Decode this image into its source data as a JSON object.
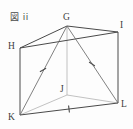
{
  "figure": {
    "caption": "図 ii",
    "background_color": "#fdfdfd",
    "line_color": "#4a4a4a",
    "hidden_line_color": "#9a9a9a",
    "label_color": "#3c3c3c",
    "shape": "triangular-prism",
    "vertices": [
      {
        "id": "G",
        "label": "G",
        "x": 67,
        "y": 26,
        "hidden": false
      },
      {
        "id": "I",
        "label": "I",
        "x": 118,
        "y": 32,
        "hidden": false
      },
      {
        "id": "H",
        "label": "H",
        "x": 20,
        "y": 48,
        "hidden": false
      },
      {
        "id": "J",
        "label": "J",
        "x": 67,
        "y": 95,
        "hidden": true
      },
      {
        "id": "K",
        "label": "K",
        "x": 20,
        "y": 115,
        "hidden": false
      },
      {
        "id": "L",
        "label": "L",
        "x": 118,
        "y": 103,
        "hidden": false
      }
    ],
    "edges": [
      {
        "from": "H",
        "to": "G",
        "style": "solid",
        "marker": "none"
      },
      {
        "from": "G",
        "to": "I",
        "style": "solid",
        "marker": "none"
      },
      {
        "from": "H",
        "to": "I",
        "style": "solid",
        "marker": "none"
      },
      {
        "from": "H",
        "to": "K",
        "style": "solid",
        "marker": "none"
      },
      {
        "from": "I",
        "to": "L",
        "style": "solid",
        "marker": "none"
      },
      {
        "from": "G",
        "to": "J",
        "style": "hidden",
        "marker": "none"
      },
      {
        "from": "K",
        "to": "L",
        "style": "solid",
        "marker": "tick"
      },
      {
        "from": "J",
        "to": "K",
        "style": "hidden",
        "marker": "none"
      },
      {
        "from": "J",
        "to": "L",
        "style": "hidden",
        "marker": "none"
      },
      {
        "from": "G",
        "to": "K",
        "style": "solid",
        "marker": "tick"
      },
      {
        "from": "G",
        "to": "L",
        "style": "solid",
        "marker": "tick"
      }
    ],
    "tick_marks": [
      {
        "on_edge": "G-K",
        "x": 43,
        "y": 70
      },
      {
        "on_edge": "G-L",
        "x": 92,
        "y": 64
      },
      {
        "on_edge": "K-L",
        "x": 69,
        "y": 109
      }
    ]
  }
}
